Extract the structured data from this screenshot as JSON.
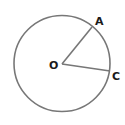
{
  "diagram": {
    "type": "circle-geometry",
    "background": "#ffffff",
    "stroke_color": "#777777",
    "label_color": "#1a1a1a",
    "circle": {
      "cx": 62,
      "cy": 63.5,
      "r": 48
    },
    "center": {
      "label": "O",
      "x": 62,
      "y": 64
    },
    "points": [
      {
        "label": "A",
        "x": 92,
        "y": 26
      },
      {
        "label": "C",
        "x": 110,
        "y": 71
      }
    ],
    "segments": [
      {
        "from": "O",
        "to": "A"
      },
      {
        "from": "O",
        "to": "C"
      }
    ],
    "labels": {
      "center": "O",
      "point_a": "A",
      "point_c": "C"
    }
  }
}
